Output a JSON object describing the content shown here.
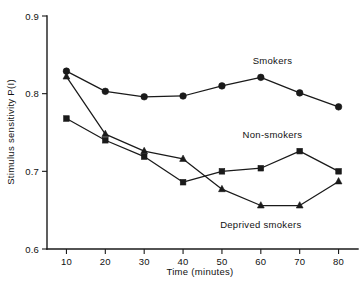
{
  "chart_data": {
    "type": "line",
    "title": "",
    "xlabel": "Time (minutes)",
    "ylabel": "Stimulus sensitivity  P(I)",
    "x": [
      10,
      20,
      30,
      40,
      50,
      60,
      70,
      80
    ],
    "xticklabels": [
      "10",
      "20",
      "30",
      "40",
      "50",
      "60",
      "70",
      "80"
    ],
    "xlim": [
      5,
      85
    ],
    "ylim": [
      0.6,
      0.9
    ],
    "yticks": [
      0.6,
      0.7,
      0.8,
      0.9
    ],
    "yticklabels": [
      "0.6",
      "0.7",
      "0.8",
      "0.9"
    ],
    "grid": false,
    "legend_position": "inline-annotations",
    "series": [
      {
        "name": "Smokers",
        "marker": "circle",
        "color": "#1a1a1a",
        "values": [
          0.829,
          0.803,
          0.796,
          0.797,
          0.81,
          0.821,
          0.801,
          0.783
        ],
        "label_x": 63,
        "label_y": 0.838
      },
      {
        "name": "Non-smokers",
        "marker": "square",
        "color": "#1a1a1a",
        "values": [
          0.768,
          0.74,
          0.719,
          0.686,
          0.7,
          0.704,
          0.726,
          0.7
        ],
        "label_x": 63,
        "label_y": 0.743
      },
      {
        "name": "Deprived smokers",
        "marker": "triangle",
        "color": "#1a1a1a",
        "values": [
          0.822,
          0.748,
          0.726,
          0.716,
          0.677,
          0.656,
          0.656,
          0.687
        ],
        "label_x": 60,
        "label_y": 0.627
      }
    ]
  },
  "axes": {
    "x_title": "Time (minutes)",
    "y_title": "Stimulus sensitivity  P(I)"
  },
  "ticks": {
    "y": [
      "0.9",
      "0.8",
      "0.7",
      "0.6"
    ],
    "x": [
      "10",
      "20",
      "30",
      "40",
      "50",
      "60",
      "70",
      "80"
    ]
  },
  "annotations": {
    "smokers": "Smokers",
    "non_smokers": "Non-smokers",
    "deprived_smokers": "Deprived smokers"
  }
}
